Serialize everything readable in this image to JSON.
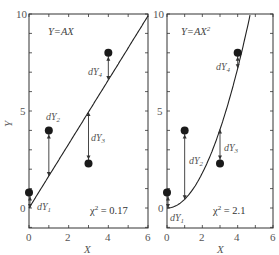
{
  "chart_data": [
    {
      "type": "scatter",
      "panel": "left",
      "title": "Y=AX",
      "model": "linear",
      "xlabel": "X",
      "ylabel": "Y",
      "xlim": [
        0,
        6
      ],
      "ylim": [
        -1,
        10
      ],
      "xticks": [
        0,
        2,
        4,
        6
      ],
      "yticks": [
        0,
        5,
        10
      ],
      "points": [
        {
          "x": 0,
          "y": 0.8,
          "label": "dY1"
        },
        {
          "x": 1,
          "y": 4.0,
          "label": "dY2"
        },
        {
          "x": 3,
          "y": 2.3,
          "label": "dY3"
        },
        {
          "x": 4,
          "y": 8.0,
          "label": "dY4"
        }
      ],
      "fit": {
        "A": 1.65
      },
      "chi_squared": 0.17,
      "chi_label": "χ² = 0.17"
    },
    {
      "type": "scatter",
      "panel": "right",
      "title": "Y=AX²",
      "model": "quadratic",
      "xlabel": "X",
      "ylabel": "",
      "xlim": [
        0,
        6
      ],
      "ylim": [
        -1,
        10
      ],
      "xticks": [
        0,
        2,
        4,
        6
      ],
      "yticks": [
        0,
        5,
        10
      ],
      "points": [
        {
          "x": 0,
          "y": 0.8,
          "label": "dY1"
        },
        {
          "x": 1,
          "y": 4.0,
          "label": "dY2"
        },
        {
          "x": 3,
          "y": 2.3,
          "label": "dY3"
        },
        {
          "x": 4,
          "y": 8.0,
          "label": "dY4"
        }
      ],
      "fit": {
        "A": 0.45
      },
      "chi_squared": 2.1,
      "chi_label": "χ² = 2.1"
    }
  ],
  "labels": {
    "left_title": "Y=AX",
    "right_title_base": "Y=AX",
    "right_title_sup": "2",
    "xlabel": "X",
    "ylabel": "Y",
    "left_chi_base": "χ",
    "left_chi_rest": " = 0.17",
    "right_chi_base": "χ",
    "right_chi_rest": " = 2.1",
    "chi_sup": "2",
    "dy_prefix": "dY",
    "dy_subs": [
      "1",
      "2",
      "3",
      "4"
    ],
    "tick_x": [
      "0",
      "2",
      "4",
      "6"
    ],
    "tick_y": [
      "0",
      "5",
      "10"
    ]
  }
}
